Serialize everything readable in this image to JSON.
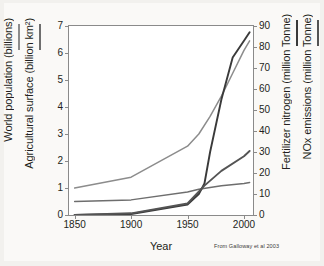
{
  "figure": {
    "citation": "From Galloway et al 2003"
  },
  "axes": {
    "x": {
      "label": "Year",
      "ticks": [
        "1850",
        "1900",
        "1950",
        "2000"
      ],
      "tick_values": [
        1850,
        1900,
        1950,
        2000
      ],
      "range": [
        1845,
        2008
      ]
    },
    "y_left": {
      "titles": [
        "World population (billions)",
        "Agricultural surface (billion km²)"
      ],
      "ticks": [
        "0",
        "1",
        "2",
        "3",
        "4",
        "5",
        "6",
        "7"
      ],
      "tick_values": [
        0,
        1,
        2,
        3,
        4,
        5,
        6,
        7
      ],
      "range": [
        0,
        7
      ]
    },
    "y_right": {
      "titles": [
        "Fertilizer nitrogen (million Tonne)",
        "NOx emissions (million Tonne)"
      ],
      "ticks": [
        "0",
        "10",
        "20",
        "30",
        "40",
        "50",
        "60",
        "70",
        "80",
        "90"
      ],
      "tick_values": [
        0,
        10,
        20,
        30,
        40,
        50,
        60,
        70,
        80,
        90
      ],
      "range": [
        0,
        90
      ]
    }
  },
  "colors": {
    "world_population": "#8c8c8c",
    "agricultural_surface": "#6e6e6e",
    "fertilizer_nitrogen": "#3a3a3a",
    "nox_emissions": "#545454",
    "frame": "#8a8a8a",
    "text": "#231f20",
    "plot_background": "#ffffff",
    "page_background": "#faf9f7"
  },
  "chart_data": {
    "type": "line",
    "title": "",
    "subtitle": "",
    "xlabel": "Year",
    "ylabel": "World population (billions) / Agricultural surface (billion km²)",
    "ylabel_right": "Fertilizer nitrogen (million Tonne) / NOx emissions (million Tonne)",
    "xlim": [
      1845,
      2008
    ],
    "ylim": [
      0,
      7
    ],
    "ylim_right": [
      0,
      90
    ],
    "grid": false,
    "legend_position": "axis-titles",
    "x": [
      1850,
      1900,
      1950,
      1960,
      1965,
      1970,
      1980,
      1990,
      2000,
      2005
    ],
    "series": [
      {
        "name": "World population (billions)",
        "axis": "left",
        "units": "billions",
        "color": "#8c8c8c",
        "x": [
          1850,
          1900,
          1950,
          1960,
          1970,
          1980,
          1990,
          2000,
          2005
        ],
        "values": [
          1.0,
          1.4,
          2.55,
          3.0,
          3.65,
          4.4,
          5.25,
          6.1,
          6.45
        ]
      },
      {
        "name": "Agricultural surface (billion km²)",
        "axis": "left",
        "units": "billion km²",
        "color": "#6e6e6e",
        "x": [
          1850,
          1900,
          1950,
          1960,
          1980,
          2000,
          2005
        ],
        "values": [
          0.5,
          0.56,
          0.85,
          0.95,
          1.08,
          1.17,
          1.2
        ]
      },
      {
        "name": "Fertilizer nitrogen (million Tonne)",
        "axis": "right",
        "units": "million Tonne",
        "color": "#3a3a3a",
        "x": [
          1850,
          1900,
          1950,
          1960,
          1965,
          1970,
          1980,
          1990,
          2000,
          2005
        ],
        "values": [
          0.0,
          0.5,
          5.0,
          10.0,
          15.0,
          30.0,
          55.0,
          75.0,
          83.0,
          87.0
        ]
      },
      {
        "name": "NOx emissions (million Tonne)",
        "axis": "right",
        "units": "million Tonne",
        "color": "#545454",
        "x": [
          1850,
          1900,
          1950,
          1965,
          1980,
          2000,
          2005
        ],
        "values": [
          0.0,
          0.8,
          5.5,
          14.0,
          21.0,
          28.0,
          30.5
        ]
      }
    ],
    "annotations": [
      "From Galloway et al 2003"
    ]
  }
}
